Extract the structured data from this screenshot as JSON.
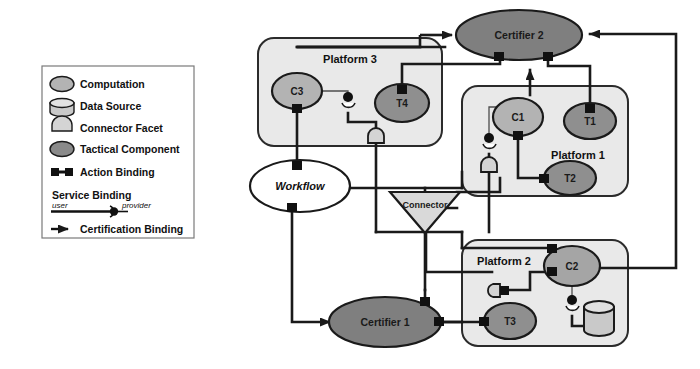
{
  "diagram": {
    "colors": {
      "certifier_fill": "#7f7f7f",
      "component_fill": "#999999",
      "computation_fill": "#b3b3b3",
      "platform_fill": "#e9e9e9",
      "connector_fill": "#d9d9d9",
      "facet_fill": "#d4d4d4",
      "datasource_fill": "#c9c9c9",
      "workflow_fill": "#ffffff",
      "stroke": "#1a1a1a",
      "thin_stroke": "#4d4d4d"
    }
  },
  "legend": {
    "items": [
      {
        "icon": "computation-ellipse-icon",
        "label": "Computation"
      },
      {
        "icon": "data-source-cylinder-icon",
        "label": "Data Source"
      },
      {
        "icon": "connector-facet-icon",
        "label": "Connector Facet"
      },
      {
        "icon": "tactical-component-ellipse-icon",
        "label": "Tactical Component"
      },
      {
        "icon": "action-binding-icon",
        "label": "Action Binding"
      }
    ],
    "service_binding": {
      "label": "Service Binding",
      "user_label": "user",
      "provider_label": "provider",
      "icon": "service-binding-icon"
    },
    "certification_binding": {
      "label": "Certification Binding",
      "icon": "certification-binding-arrow-icon"
    }
  },
  "nodes": {
    "certifier2": {
      "label": "Certifier 2",
      "type": "certifier"
    },
    "certifier1": {
      "label": "Certifier 1",
      "type": "certifier"
    },
    "workflow": {
      "label": "Workflow",
      "type": "workflow"
    },
    "connector": {
      "label": "Connector",
      "type": "connector"
    },
    "c1": {
      "label": "C1",
      "type": "computation"
    },
    "c2": {
      "label": "C2",
      "type": "computation"
    },
    "c3": {
      "label": "C3",
      "type": "computation"
    },
    "t1": {
      "label": "T1",
      "type": "tactical"
    },
    "t2": {
      "label": "T2",
      "type": "tactical"
    },
    "t3": {
      "label": "T3",
      "type": "tactical"
    },
    "t4": {
      "label": "T4",
      "type": "tactical"
    },
    "datasource": {
      "label": "",
      "type": "data-source"
    }
  },
  "platforms": [
    {
      "id": "platform3",
      "label": "Platform 3",
      "members": [
        "c3",
        "t4"
      ]
    },
    {
      "id": "platform1",
      "label": "Platform 1",
      "members": [
        "c1",
        "t1",
        "t2"
      ]
    },
    {
      "id": "platform2",
      "label": "Platform 2",
      "members": [
        "c2",
        "t3",
        "datasource"
      ]
    }
  ]
}
